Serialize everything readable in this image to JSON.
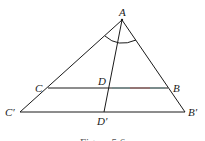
{
  "figure": {
    "points": {
      "A": {
        "label": "A",
        "x": 122,
        "y": 20
      },
      "C": {
        "label": "C",
        "x": 48,
        "y": 88
      },
      "B": {
        "label": "B",
        "x": 168,
        "y": 88
      },
      "D": {
        "label": "D",
        "x": 110,
        "y": 88
      },
      "C_prime": {
        "label": "C′",
        "x": 20,
        "y": 112
      },
      "B_prime": {
        "label": "B′",
        "x": 185,
        "y": 112
      },
      "D_prime": {
        "label": "D′",
        "x": 104,
        "y": 112
      }
    },
    "caption": "Figure 5.6",
    "line_color": "#1a1a1a",
    "highlight_color": "#c0504d"
  }
}
